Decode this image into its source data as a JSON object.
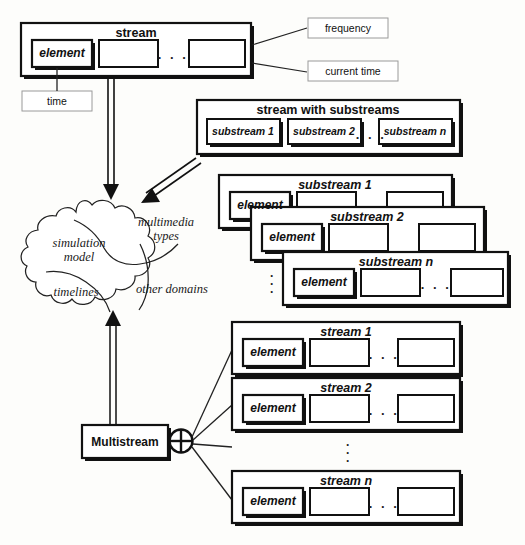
{
  "figure": {
    "ellipsis": ". . .",
    "vertical_ellipsis": "·"
  },
  "stream_box": {
    "title": "stream",
    "element_label": "element",
    "cells": [
      "element",
      "",
      ""
    ],
    "ellipsis": ". . ."
  },
  "annotations": {
    "frequency": "frequency",
    "current_time": "current time",
    "time": "time"
  },
  "substreams_box": {
    "title": "stream with substreams",
    "items": [
      "substream 1",
      "substream 2",
      "substream n"
    ],
    "ellipsis": ". . ."
  },
  "substream_stack": [
    {
      "title": "substream 1",
      "element_label": "element",
      "ellipsis": ". . ."
    },
    {
      "title": "substream 2",
      "element_label": "element",
      "ellipsis": ". . ."
    },
    {
      "title": "substream n",
      "element_label": "element",
      "ellipsis": ". . ."
    }
  ],
  "cloud": {
    "regions": [
      {
        "label": "multimedia\ntypes",
        "line1": "multimedia",
        "line2": "types"
      },
      {
        "label": "simulation\nmodel",
        "line1": "simulation",
        "line2": "model"
      },
      {
        "label": "timelines",
        "line1": "timelines",
        "line2": ""
      },
      {
        "label": "other domains",
        "line1": "other domains",
        "line2": ""
      }
    ]
  },
  "multistream": {
    "label": "Multistream",
    "operator": "circled-plus"
  },
  "stream_stack": [
    {
      "title": "stream 1",
      "element_label": "element",
      "ellipsis": ". . ."
    },
    {
      "title": "stream 2",
      "element_label": "element",
      "ellipsis": ". . ."
    },
    {
      "title": "stream n",
      "element_label": "element",
      "ellipsis": ". . ."
    }
  ],
  "colors": {
    "ink": "#111111",
    "shadow": "#1a1a1a",
    "paper": "#fdfdfb",
    "thin_border": "#8a8a8a"
  }
}
